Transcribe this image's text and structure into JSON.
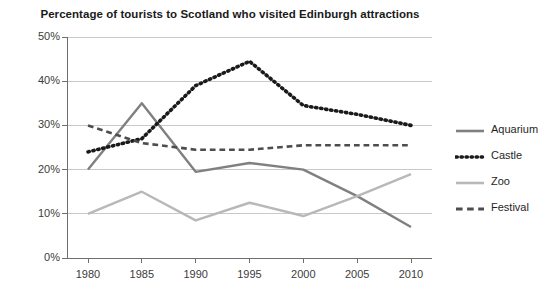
{
  "chart_data": {
    "type": "line",
    "title": "Percentage of tourists to Scotland who visited Edinburgh attractions",
    "xlabel": "",
    "ylabel": "",
    "categories": [
      "1980",
      "1985",
      "1990",
      "1995",
      "2000",
      "2005",
      "2010"
    ],
    "x": [
      1980,
      1985,
      1990,
      1995,
      2000,
      2005,
      2010
    ],
    "ylim": [
      0,
      50
    ],
    "xlim": [
      1980,
      2010
    ],
    "yticks": [
      "0%",
      "10%",
      "20%",
      "30%",
      "40%",
      "50%"
    ],
    "ytick_values": [
      0,
      10,
      20,
      30,
      40,
      50
    ],
    "grid": "horizontal",
    "legend_position": "right",
    "series": [
      {
        "name": "Aquarium",
        "values": [
          20,
          35,
          19.5,
          21.5,
          20,
          14,
          7
        ],
        "color": "#808080",
        "style": "solid"
      },
      {
        "name": "Castle",
        "values": [
          24,
          27,
          39,
          44.5,
          34.5,
          32.5,
          30
        ],
        "color": "#1a1a1a",
        "style": "dotted"
      },
      {
        "name": "Zoo",
        "values": [
          10,
          15,
          8.5,
          12.5,
          9.5,
          14,
          19
        ],
        "color": "#b8b8b8",
        "style": "solid"
      },
      {
        "name": "Festival",
        "values": [
          30,
          26,
          24.5,
          24.5,
          25.5,
          25.5,
          25.5
        ],
        "color": "#4d4d4d",
        "style": "dashed"
      }
    ]
  },
  "legend": {
    "items": [
      {
        "label": "Aquarium"
      },
      {
        "label": "Castle"
      },
      {
        "label": "Zoo"
      },
      {
        "label": "Festival"
      }
    ]
  }
}
